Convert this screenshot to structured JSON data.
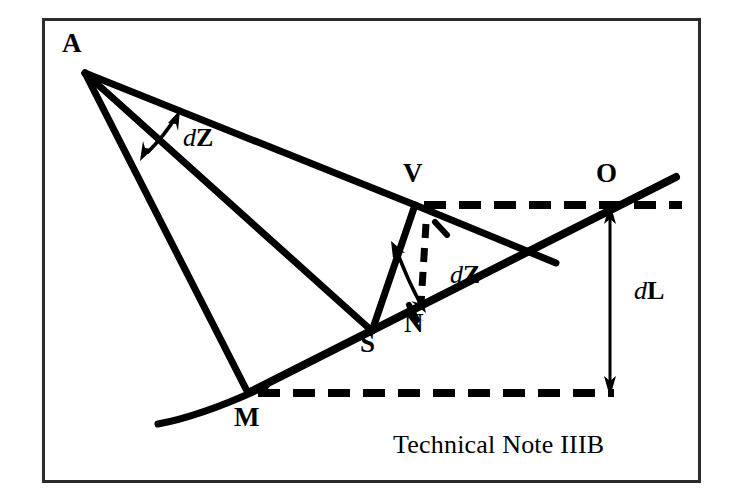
{
  "figure": {
    "caption": "Technical Note IIIB",
    "background_color": "#ffffff",
    "ink_color": "#000000",
    "frame": {
      "x": 42,
      "y": 18,
      "width": 658,
      "height": 464,
      "border_width": 3
    }
  },
  "points": [
    {
      "id": "A",
      "label": "A",
      "x": 85,
      "y": 73,
      "label_x": 62,
      "label_y": 30
    },
    {
      "id": "V",
      "label": "V",
      "x": 415,
      "y": 205,
      "label_x": 403,
      "label_y": 160
    },
    {
      "id": "O",
      "label": "O",
      "x": 608,
      "y": 205,
      "label_x": 596,
      "label_y": 160
    },
    {
      "id": "N",
      "label": "N",
      "x": 415,
      "y": 318,
      "label_x": 404,
      "label_y": 310
    },
    {
      "id": "S",
      "label": "S",
      "x": 372,
      "y": 331,
      "label_x": 360,
      "label_y": 330
    },
    {
      "id": "M",
      "label": "M",
      "x": 248,
      "y": 393,
      "label_x": 234,
      "label_y": 404
    }
  ],
  "annotations": [
    {
      "id": "dZ-upper",
      "prefix": "d",
      "symbol": "Z",
      "label_x": 183,
      "label_y": 125,
      "description": "angle between line A-V and line A-S"
    },
    {
      "id": "dZ-lower",
      "prefix": "d",
      "symbol": "Z",
      "label_x": 450,
      "label_y": 262,
      "description": "angle at V between V-S and V-N"
    },
    {
      "id": "dL",
      "prefix": "d",
      "symbol": "L",
      "label_x": 634,
      "label_y": 278,
      "description": "vertical separation between the two dashed horizontals"
    }
  ],
  "segments": {
    "solid": [
      {
        "name": "A-to-V",
        "from": [
          85,
          73
        ],
        "to": [
          415,
          205
        ]
      },
      {
        "name": "A-to-S",
        "from": [
          85,
          73
        ],
        "to": [
          372,
          331
        ]
      },
      {
        "name": "A-to-M",
        "from": [
          85,
          73
        ],
        "to": [
          248,
          393
        ]
      },
      {
        "name": "V-to-S",
        "from": [
          415,
          205
        ],
        "to": [
          372,
          331
        ]
      },
      {
        "name": "V-to-lower-right",
        "from": [
          415,
          205
        ],
        "to": [
          556,
          263
        ]
      },
      {
        "name": "M-to-upper-right",
        "from": [
          248,
          393
        ],
        "to": [
          676,
          177
        ]
      },
      {
        "name": "terrain-curve",
        "from": [
          158,
          424
        ],
        "to": [
          262,
          387
        ]
      }
    ],
    "dashed": [
      {
        "name": "horizontal-through-V",
        "from": [
          415,
          205
        ],
        "to": [
          682,
          205
        ]
      },
      {
        "name": "horizontal-through-M",
        "from": [
          255,
          393
        ],
        "to": [
          614,
          393
        ]
      },
      {
        "name": "vertical-drop-from-V",
        "from": [
          424,
          228
        ],
        "to": [
          420,
          318
        ]
      }
    ],
    "dimension": [
      {
        "name": "dL-double-arrow",
        "x": 610,
        "y_top": 208,
        "y_bottom": 391
      }
    ],
    "angle_arcs": [
      {
        "name": "dZ-upper-arc",
        "description": "double-headed curved arrow across angle at A"
      },
      {
        "name": "dZ-lower-arc",
        "description": "double-headed curved arrow across angle at V"
      }
    ]
  }
}
